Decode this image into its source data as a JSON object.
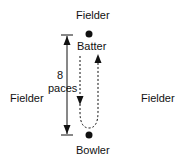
{
  "diagram": {
    "labels": {
      "fielder_top": "Fielder",
      "fielder_left": "Fielder",
      "fielder_right": "Fielder",
      "batter": "Batter",
      "bowler": "Bowler",
      "distance_number": "8",
      "distance_unit": "paces"
    },
    "colors": {
      "ink": "#111111",
      "background": "#ffffff"
    }
  }
}
